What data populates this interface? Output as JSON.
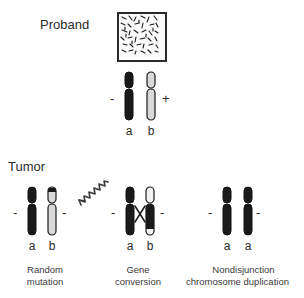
{
  "figure": {
    "type": "diagram",
    "background_color": "#ffffff",
    "ink_color": "#231f20"
  },
  "sections": {
    "proband": {
      "label": "Proband",
      "tissue_panel": {
        "name": "histology-tissue-panel",
        "border_color": "#2a2a2a",
        "fill_color": "#fbfbfb",
        "speckle_color": "#1c1c1c"
      },
      "karyotype": {
        "left_sign": "-",
        "right_sign": "+",
        "chromosomes": [
          {
            "allele": "a",
            "fill": "dark",
            "color": "#1a1a1a"
          },
          {
            "allele": "b",
            "fill": "light",
            "color": "#d4d4d4"
          }
        ]
      }
    },
    "tumor": {
      "label": "Tumor",
      "panels": [
        {
          "id": "random-mutation",
          "caption_line1": "Random",
          "caption_line2": "mutation",
          "left_sign": "-",
          "right_sign": "-",
          "mutagen_icon": "zigzag-arrow-icon",
          "chromosomes": [
            {
              "allele": "a",
              "fill": "dark",
              "color": "#1a1a1a"
            },
            {
              "allele": "b",
              "fill": "light-with-dark-tip",
              "color": "#d4d4d4",
              "tip_color": "#1a1a1a"
            }
          ]
        },
        {
          "id": "gene-conversion",
          "caption_line1": "Gene",
          "caption_line2": "conversion",
          "left_sign": "-",
          "right_sign": "-",
          "crossover_icon": "x-crossover-icon",
          "chromosomes": [
            {
              "allele": "a",
              "fill": "dark",
              "color": "#1a1a1a"
            },
            {
              "allele": "b",
              "fill": "light-top-dark-body",
              "color": "#f2f2f2",
              "converted_color": "#1a1a1a"
            }
          ]
        },
        {
          "id": "nondisjunction-chromosome-duplication",
          "caption_line1": "Nondisjunction",
          "caption_line2": "chromosome duplication",
          "left_sign": "-",
          "right_sign": "-",
          "chromosomes": [
            {
              "allele": "a",
              "fill": "dark",
              "color": "#1a1a1a"
            },
            {
              "allele": "a",
              "fill": "dark",
              "color": "#1a1a1a"
            }
          ]
        }
      ]
    }
  }
}
